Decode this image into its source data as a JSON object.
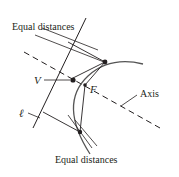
{
  "figure": {
    "labels": {
      "top_equal_distances": "Equal distances",
      "bottom_equal_distances": "Equal distances",
      "vertex": "V",
      "focus": "F",
      "axis": "Axis",
      "directrix": "ℓ"
    },
    "colors": {
      "line": "#231f20",
      "curve": "#555555",
      "background": "#ffffff"
    },
    "elements": {
      "curve": "parabola",
      "axis_style": "dashed",
      "points": [
        "vertex",
        "focus",
        "upper-point",
        "lower-point"
      ]
    }
  }
}
